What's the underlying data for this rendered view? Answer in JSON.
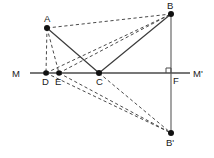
{
  "figure": {
    "background_color": "#ffffff",
    "line_color": "#4a4a4a",
    "point_color": "#111111",
    "width": 214,
    "height": 158
  },
  "points": {
    "A": {
      "label": "A",
      "x": 47,
      "y": 28,
      "label_x": 44,
      "label_y": 22
    },
    "B": {
      "label": "B",
      "x": 171,
      "y": 14,
      "label_x": 167,
      "label_y": 9
    },
    "C": {
      "label": "C",
      "x": 99,
      "y": 73,
      "label_x": 96,
      "label_y": 85
    },
    "D": {
      "label": "D",
      "x": 46,
      "y": 73,
      "label_x": 42,
      "label_y": 85
    },
    "E": {
      "label": "E",
      "x": 59,
      "y": 73,
      "label_x": 55,
      "label_y": 85
    },
    "F": {
      "label": "F",
      "x": 171,
      "y": 73,
      "label_x": 173,
      "label_y": 84
    },
    "Bp": {
      "label": "B'",
      "x": 171,
      "y": 133,
      "label_x": 167,
      "label_y": 146
    },
    "M": {
      "label": "M",
      "x": 30,
      "y": 73,
      "label_x": 14,
      "label_y": 77
    },
    "Mp": {
      "label": "M'",
      "x": 190,
      "y": 73,
      "label_x": 193,
      "label_y": 77
    }
  },
  "lines": {
    "axis": {
      "name": "line-MM-prime",
      "from": "M",
      "to": "Mp",
      "style": "solid"
    },
    "vertical": {
      "name": "line-B-Bprime",
      "from": "B",
      "to": "Bp",
      "style": "solid"
    },
    "solid_segments": [
      {
        "name": "segment-A-C",
        "from": "A",
        "to": "C"
      },
      {
        "name": "segment-C-B",
        "from": "C",
        "to": "B"
      }
    ],
    "dashed_segments": [
      {
        "name": "segment-A-B",
        "from": "A",
        "to": "B"
      },
      {
        "name": "segment-A-D",
        "from": "A",
        "to": "D"
      },
      {
        "name": "segment-A-E",
        "from": "A",
        "to": "E"
      },
      {
        "name": "segment-D-B",
        "from": "D",
        "to": "B"
      },
      {
        "name": "segment-E-B",
        "from": "E",
        "to": "B"
      },
      {
        "name": "segment-D-Bprime",
        "from": "D",
        "to": "Bp"
      },
      {
        "name": "segment-E-Bprime",
        "from": "E",
        "to": "Bp"
      },
      {
        "name": "segment-C-Bprime",
        "from": "C",
        "to": "Bp"
      }
    ]
  },
  "markers": {
    "right_angle_at_F": {
      "name": "right-angle-marker-F",
      "x": 166,
      "y": 68,
      "size": 5
    }
  }
}
